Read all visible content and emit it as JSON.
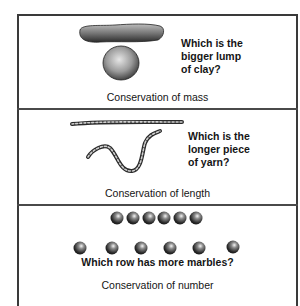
{
  "panels": [
    {
      "id": "mass",
      "question": "Which is the\nbigger lump\nof clay?",
      "caption": "Conservation of mass",
      "objects": [
        "clay-roll",
        "clay-ball"
      ]
    },
    {
      "id": "length",
      "question": "Which is the\nlonger piece\nof yarn?",
      "caption": "Conservation of length",
      "objects": [
        "straight-yarn",
        "curved-yarn"
      ]
    },
    {
      "id": "number",
      "question": "Which row has more marbles?",
      "caption": "Conservation of number",
      "objects": [
        "marble-row-compact",
        "marble-row-spread"
      ],
      "marble_rows": [
        {
          "name": "compact",
          "count": 6
        },
        {
          "name": "spread",
          "count": 6
        }
      ]
    }
  ]
}
